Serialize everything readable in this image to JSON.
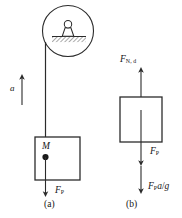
{
  "figure": {
    "type": "free-body-diagram",
    "background_color": "#ffffff",
    "stroke_color": "#2b2b2b"
  },
  "panel_a": {
    "caption": "(a)",
    "mass_label": "M",
    "acceleration_label": "a",
    "force_label_F": "F",
    "force_label_sub": "P",
    "ceiling_inset": {
      "name": "magnified-ceiling-attachment",
      "hatching": "diagonal",
      "support_shape": "trapezoid-with-knob"
    }
  },
  "panel_b": {
    "caption": "(b)",
    "top_force_F": "F",
    "top_force_sub": "N, d",
    "mid_force_F": "F",
    "mid_force_sub": "P",
    "bottom_force_F": "F",
    "bottom_force_sub": "P",
    "bottom_force_expr_num": "a",
    "bottom_force_expr_slash": "/",
    "bottom_force_expr_den": "g"
  }
}
